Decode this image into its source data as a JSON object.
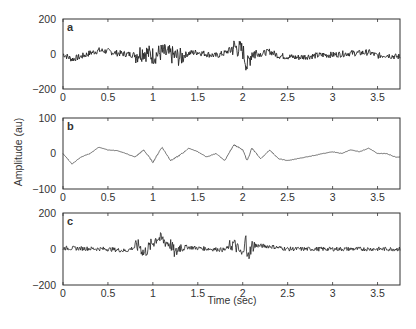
{
  "figure": {
    "ylabel": "Amplitude (au)",
    "xlabel": "Time (sec)"
  },
  "chart_data": [
    {
      "type": "line",
      "panel_label": "a",
      "xlabel": "",
      "ylabel": "Amplitude (au)",
      "xlim": [
        0,
        3.75
      ],
      "ylim": [
        -200,
        200
      ],
      "x_ticks": [
        "0",
        "0.5",
        "1",
        "1.5",
        "2",
        "2.5",
        "3",
        "3.5"
      ],
      "y_ticks": [
        "200",
        "0",
        "-200"
      ],
      "grid": false,
      "description": "Noisy signal near 0; dip to about -30 near 0.1 s, burst activity 0.7-1.3 s, largest burst ~1.9-2.1 s reaching about +60/-80, quieter after 2.3 s.",
      "x": [
        0,
        0.1,
        0.2,
        0.3,
        0.4,
        0.5,
        0.6,
        0.7,
        0.8,
        0.9,
        1.0,
        1.1,
        1.2,
        1.3,
        1.4,
        1.5,
        1.6,
        1.7,
        1.8,
        1.9,
        2.0,
        2.05,
        2.1,
        2.2,
        2.3,
        2.4,
        2.5,
        2.6,
        2.7,
        2.8,
        2.9,
        3.0,
        3.1,
        3.2,
        3.3,
        3.4,
        3.5,
        3.6,
        3.7
      ],
      "values": [
        0,
        -30,
        -15,
        5,
        20,
        15,
        5,
        0,
        -5,
        15,
        -10,
        10,
        -5,
        -20,
        5,
        10,
        0,
        -10,
        5,
        40,
        20,
        -70,
        10,
        0,
        15,
        -10,
        -15,
        -20,
        -15,
        -10,
        -5,
        -5,
        0,
        5,
        5,
        10,
        -10,
        -5,
        -15
      ]
    },
    {
      "type": "line",
      "panel_label": "b",
      "xlabel": "",
      "ylabel": "Amplitude (au)",
      "xlim": [
        0,
        3.75
      ],
      "ylim": [
        -100,
        100
      ],
      "x_ticks": [
        "0",
        "0.5",
        "1",
        "1.5",
        "2",
        "2.5",
        "3",
        "3.5"
      ],
      "y_ticks": [
        "100",
        "0",
        "-100"
      ],
      "grid": false,
      "description": "Smoother low-frequency signal; dip to about -30 near 0.1 s, peaks ~+20 near 0.4 s, oscillations -25..+25 between 0.8-2.3 s, slow drift -20..+10 afterwards.",
      "x": [
        0,
        0.1,
        0.2,
        0.3,
        0.4,
        0.5,
        0.6,
        0.7,
        0.8,
        0.9,
        1.0,
        1.1,
        1.2,
        1.3,
        1.4,
        1.5,
        1.6,
        1.7,
        1.8,
        1.9,
        2.0,
        2.05,
        2.1,
        2.2,
        2.3,
        2.4,
        2.5,
        2.6,
        2.7,
        2.8,
        2.9,
        3.0,
        3.1,
        3.2,
        3.3,
        3.4,
        3.5,
        3.6,
        3.7
      ],
      "values": [
        0,
        -30,
        -10,
        0,
        18,
        10,
        8,
        0,
        -10,
        10,
        -25,
        18,
        -20,
        -5,
        15,
        5,
        -10,
        0,
        -20,
        25,
        10,
        -20,
        15,
        -15,
        10,
        -15,
        -20,
        -15,
        -10,
        -5,
        0,
        5,
        0,
        10,
        5,
        15,
        0,
        0,
        -10
      ]
    },
    {
      "type": "line",
      "panel_label": "c",
      "xlabel": "Time (sec)",
      "ylabel": "Amplitude (au)",
      "xlim": [
        0,
        3.75
      ],
      "ylim": [
        -200,
        200
      ],
      "x_ticks": [
        "0",
        "0.5",
        "1",
        "1.5",
        "2",
        "2.5",
        "3",
        "3.5"
      ],
      "y_ticks": [
        "200",
        "0",
        "-200"
      ],
      "grid": false,
      "description": "High-frequency component near 0 with small noise; bursts near 0.9 s, spike ~+65 near 1.05 s, bursts 1.2-1.3 s, largest burst ~1.9-2.1 s reaching about +90/-60, flat thereafter.",
      "x": [
        0,
        0.5,
        0.7,
        0.85,
        0.9,
        1.05,
        1.2,
        1.25,
        1.3,
        1.5,
        1.8,
        1.9,
        2.0,
        2.03,
        2.05,
        2.1,
        2.3,
        2.5,
        3.0,
        3.5,
        3.7
      ],
      "values": [
        5,
        0,
        -10,
        20,
        -25,
        65,
        25,
        -30,
        15,
        5,
        -5,
        30,
        -40,
        90,
        -60,
        20,
        15,
        0,
        0,
        0,
        0
      ]
    }
  ],
  "panels": [
    {
      "label": "a",
      "yticks": [
        "200",
        "0",
        "−200"
      ],
      "xticks": [
        "0",
        "0.5",
        "1",
        "1.5",
        "2",
        "2.5",
        "3",
        "3.5"
      ]
    },
    {
      "label": "b",
      "yticks": [
        "100",
        "0",
        "−100"
      ],
      "xticks": [
        "0",
        "0.5",
        "1",
        "1.5",
        "2",
        "2.5",
        "3",
        "3.5"
      ]
    },
    {
      "label": "c",
      "yticks": [
        "200",
        "0",
        "−200"
      ],
      "xticks": [
        "0",
        "0.5",
        "1",
        "1.5",
        "2",
        "2.5",
        "3",
        "3.5"
      ]
    }
  ]
}
